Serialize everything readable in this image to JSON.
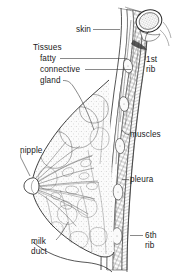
{
  "figure": {
    "type": "anatomical-illustration",
    "style": "pen-and-ink line drawing, black on white, stippled and cross-hatched shading",
    "background_color": "#ffffff",
    "ink_color": "#2b2b2b",
    "width": 172,
    "height": 275
  },
  "labels": [
    {
      "id": "skin",
      "text": "skin",
      "x": 76,
      "y": 32,
      "anchor": "start",
      "leader": "horizontal line running right from label to the outer skin layer of the chest wall"
    },
    {
      "id": "tissues",
      "text": "Tissues",
      "x": 33,
      "y": 50,
      "anchor": "start",
      "leader": "none; heading for the three tissue sub-labels below"
    },
    {
      "id": "fatty",
      "text": "fatty",
      "x": 40,
      "y": 61,
      "anchor": "start",
      "leader": "horizontal line running right to the subcutaneous fat layer"
    },
    {
      "id": "connective",
      "text": "connective",
      "x": 40,
      "y": 72,
      "anchor": "start",
      "leader": "horizontal line running right to the connective tissue layer"
    },
    {
      "id": "gland",
      "text": "gland",
      "x": 40,
      "y": 83,
      "anchor": "start",
      "leader": "short hook then long diagonal down-right into the glandular lobules"
    },
    {
      "id": "first-rib",
      "text": "1st\nrib",
      "line1": "1st",
      "line2": "rib",
      "x": 146,
      "y": 62,
      "anchor": "start",
      "leader": "short vertical hook up to the oval rib cross-section at top right"
    },
    {
      "id": "muscles",
      "text": "muscles",
      "x": 130,
      "y": 137,
      "anchor": "start",
      "leader": "short hook left to the cross-hatched intercostal muscle band"
    },
    {
      "id": "pleura",
      "text": "pleura",
      "x": 130,
      "y": 182,
      "anchor": "start",
      "leader": "short dash left to the inner pleural lining of the chest wall"
    },
    {
      "id": "nipple",
      "text": "nipple",
      "x": 20,
      "y": 153,
      "anchor": "start",
      "leader": "diagonal line down-right from below the label to the nipple tip"
    },
    {
      "id": "milk-duct",
      "text": "milk\nduct",
      "line1": "milk",
      "line2": "duct",
      "x": 31,
      "y": 244,
      "anchor": "start",
      "leader": "diagonal line up-right into the radiating lactiferous ducts"
    },
    {
      "id": "sixth-rib",
      "text": "6th\nrib",
      "line1": "6th",
      "line2": "rib",
      "x": 145,
      "y": 238,
      "anchor": "start",
      "leader": "short dash left to the lowest oval rib cross-section"
    }
  ],
  "structures": [
    {
      "id": "breast-contour",
      "name": "breast outer contour",
      "description": "large teardrop curve bulging left from the chest wall, apex at the nipple"
    },
    {
      "id": "chest-wall",
      "name": "chest wall layered band",
      "description": "near-vertical stack of parallel layers curving from top right down to bottom"
    },
    {
      "id": "first-rib-section",
      "name": "1st rib cross-section",
      "description": "large stippled oval at the top right of the chest wall"
    },
    {
      "id": "rib-sections",
      "name": "rib cross-sections",
      "description": "series of small pale ovals spaced down the chest wall"
    },
    {
      "id": "fat-lobules",
      "name": "fatty lobules",
      "description": "irregular rounded outlined compartments filling the upper breast"
    },
    {
      "id": "lactiferous-ducts",
      "name": "milk ducts",
      "description": "fan of fine branching lines radiating from the nipple into the gland"
    },
    {
      "id": "nipple-tip",
      "name": "nipple",
      "description": "pointed projection at the left apex of the breast contour"
    },
    {
      "id": "muscle-hatching",
      "name": "intercostal muscle hatching",
      "description": "dense diagonal cross-hatch band between ribs and pleura"
    }
  ]
}
